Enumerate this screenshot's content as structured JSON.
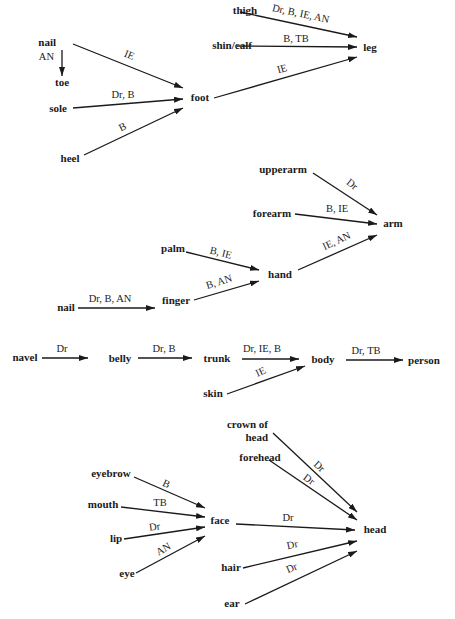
{
  "diagram": {
    "nodes": [
      {
        "id": "nail1",
        "label": "nail",
        "x": 56,
        "y": 46,
        "anchor": "end"
      },
      {
        "id": "toe",
        "label": "toe",
        "x": 62,
        "y": 86,
        "anchor": "middle"
      },
      {
        "id": "sole",
        "label": "sole",
        "x": 58,
        "y": 112,
        "anchor": "middle"
      },
      {
        "id": "heel",
        "label": "heel",
        "x": 70,
        "y": 162,
        "anchor": "middle"
      },
      {
        "id": "foot",
        "label": "foot",
        "x": 200,
        "y": 101,
        "anchor": "middle"
      },
      {
        "id": "thigh",
        "label": "thigh",
        "x": 245,
        "y": 14,
        "anchor": "middle"
      },
      {
        "id": "shin",
        "label": "shin/calf",
        "x": 232,
        "y": 49,
        "anchor": "middle"
      },
      {
        "id": "leg",
        "label": "leg",
        "x": 370,
        "y": 51,
        "anchor": "middle"
      },
      {
        "id": "upperarm",
        "label": "upperarm",
        "x": 283,
        "y": 173,
        "anchor": "middle"
      },
      {
        "id": "forearm",
        "label": "forearm",
        "x": 272,
        "y": 217,
        "anchor": "middle"
      },
      {
        "id": "arm",
        "label": "arm",
        "x": 393,
        "y": 227,
        "anchor": "middle"
      },
      {
        "id": "palm",
        "label": "palm",
        "x": 173,
        "y": 252,
        "anchor": "middle"
      },
      {
        "id": "hand",
        "label": "hand",
        "x": 280,
        "y": 278,
        "anchor": "middle"
      },
      {
        "id": "nail2",
        "label": "nail",
        "x": 66,
        "y": 311,
        "anchor": "middle"
      },
      {
        "id": "finger",
        "label": "finger",
        "x": 176,
        "y": 304,
        "anchor": "middle"
      },
      {
        "id": "navel",
        "label": "navel",
        "x": 25,
        "y": 361,
        "anchor": "middle"
      },
      {
        "id": "belly",
        "label": "belly",
        "x": 120,
        "y": 362,
        "anchor": "middle"
      },
      {
        "id": "trunk",
        "label": "trunk",
        "x": 217,
        "y": 362,
        "anchor": "middle"
      },
      {
        "id": "body",
        "label": "body",
        "x": 323,
        "y": 363,
        "anchor": "middle"
      },
      {
        "id": "person",
        "label": "person",
        "x": 424,
        "y": 364,
        "anchor": "middle"
      },
      {
        "id": "skin",
        "label": "skin",
        "x": 213,
        "y": 397,
        "anchor": "middle"
      },
      {
        "id": "crown",
        "label": "crown of",
        "label2": "head",
        "x": 268,
        "y": 428,
        "anchor": "end"
      },
      {
        "id": "forehead",
        "label": "forehead",
        "x": 260,
        "y": 461,
        "anchor": "middle"
      },
      {
        "id": "eyebrow",
        "label": "eyebrow",
        "x": 111,
        "y": 477,
        "anchor": "middle"
      },
      {
        "id": "mouth",
        "label": "mouth",
        "x": 103,
        "y": 508,
        "anchor": "middle"
      },
      {
        "id": "face",
        "label": "face",
        "x": 220,
        "y": 524,
        "anchor": "middle"
      },
      {
        "id": "head",
        "label": "head",
        "x": 375,
        "y": 533,
        "anchor": "middle"
      },
      {
        "id": "lip",
        "label": "lip",
        "x": 116,
        "y": 542,
        "anchor": "middle"
      },
      {
        "id": "eye",
        "label": "eye",
        "x": 127,
        "y": 577,
        "anchor": "middle"
      },
      {
        "id": "hair",
        "label": "hair",
        "x": 231,
        "y": 571,
        "anchor": "middle"
      },
      {
        "id": "ear",
        "label": "ear",
        "x": 232,
        "y": 607,
        "anchor": "middle"
      }
    ],
    "edges": [
      {
        "from": "nail1",
        "to": "foot",
        "label": "IE",
        "x1": 73,
        "y1": 44,
        "x2": 183,
        "y2": 88,
        "lx": 128,
        "ly": 58,
        "rot": 22
      },
      {
        "from": "nail1",
        "to": "toe",
        "label": "AN",
        "x1": 62,
        "y1": 50,
        "x2": 62,
        "y2": 76,
        "lx": 54,
        "ly": 60,
        "rot": 0,
        "anchor": "end"
      },
      {
        "from": "sole",
        "to": "foot",
        "label": "Dr, B",
        "x1": 73,
        "y1": 108,
        "x2": 183,
        "y2": 99,
        "lx": 123,
        "ly": 98,
        "rot": 0
      },
      {
        "from": "heel",
        "to": "foot",
        "label": "B",
        "x1": 84,
        "y1": 155,
        "x2": 183,
        "y2": 108,
        "lx": 124,
        "ly": 130,
        "rot": -25
      },
      {
        "from": "thigh",
        "to": "leg",
        "label": "Dr, B, IE, AN",
        "x1": 240,
        "y1": 12,
        "x2": 357,
        "y2": 37,
        "lx": 300,
        "ly": 17,
        "rot": 12
      },
      {
        "from": "shin",
        "to": "leg",
        "label": "B, TB",
        "x1": 237,
        "y1": 46,
        "x2": 357,
        "y2": 47,
        "lx": 296,
        "ly": 42,
        "rot": 0
      },
      {
        "from": "foot",
        "to": "leg",
        "label": "IE",
        "x1": 214,
        "y1": 98,
        "x2": 357,
        "y2": 57,
        "lx": 283,
        "ly": 72,
        "rot": -16
      },
      {
        "from": "upperarm",
        "to": "arm",
        "label": "Dr",
        "x1": 313,
        "y1": 173,
        "x2": 377,
        "y2": 215,
        "lx": 350,
        "ly": 187,
        "rot": 38
      },
      {
        "from": "forearm",
        "to": "arm",
        "label": "B, IE",
        "x1": 295,
        "y1": 214,
        "x2": 377,
        "y2": 224,
        "lx": 337,
        "ly": 212,
        "rot": 0
      },
      {
        "from": "hand",
        "to": "arm",
        "label": "IE, AN",
        "x1": 298,
        "y1": 270,
        "x2": 377,
        "y2": 235,
        "lx": 338,
        "ly": 244,
        "rot": -25
      },
      {
        "from": "palm",
        "to": "hand",
        "label": "B, IE",
        "x1": 186,
        "y1": 252,
        "x2": 259,
        "y2": 270,
        "lx": 220,
        "ly": 256,
        "rot": 14
      },
      {
        "from": "finger",
        "to": "hand",
        "label": "B, AN",
        "x1": 194,
        "y1": 300,
        "x2": 259,
        "y2": 281,
        "lx": 220,
        "ly": 285,
        "rot": -17
      },
      {
        "from": "nail2",
        "to": "finger",
        "label": "Dr, B, AN",
        "x1": 78,
        "y1": 308,
        "x2": 155,
        "y2": 308,
        "lx": 110,
        "ly": 302,
        "rot": 0
      },
      {
        "from": "navel",
        "to": "belly",
        "label": "Dr",
        "x1": 42,
        "y1": 358,
        "x2": 88,
        "y2": 358,
        "lx": 62,
        "ly": 352,
        "rot": 0
      },
      {
        "from": "belly",
        "to": "trunk",
        "label": "Dr, B",
        "x1": 138,
        "y1": 358,
        "x2": 192,
        "y2": 358,
        "lx": 164,
        "ly": 352,
        "rot": 0
      },
      {
        "from": "trunk",
        "to": "body",
        "label": "Dr, IE,  B",
        "x1": 242,
        "y1": 359,
        "x2": 299,
        "y2": 359,
        "lx": 262,
        "ly": 352,
        "rot": 0
      },
      {
        "from": "skin",
        "to": "body",
        "label": "IE",
        "x1": 227,
        "y1": 394,
        "x2": 305,
        "y2": 366,
        "lx": 262,
        "ly": 375,
        "rot": -25
      },
      {
        "from": "body",
        "to": "person",
        "label": "Dr, TB",
        "x1": 346,
        "y1": 360,
        "x2": 403,
        "y2": 360,
        "lx": 366,
        "ly": 354,
        "rot": 0
      },
      {
        "from": "crown",
        "to": "head",
        "label": "Dr",
        "x1": 273,
        "y1": 433,
        "x2": 357,
        "y2": 512,
        "lx": 317,
        "ly": 469,
        "rot": 42
      },
      {
        "from": "forehead",
        "to": "head",
        "label": "Dr",
        "x1": 269,
        "y1": 460,
        "x2": 357,
        "y2": 520,
        "lx": 307,
        "ly": 482,
        "rot": 36
      },
      {
        "from": "eyebrow",
        "to": "face",
        "label": "B",
        "x1": 134,
        "y1": 477,
        "x2": 205,
        "y2": 508,
        "lx": 165,
        "ly": 487,
        "rot": 24
      },
      {
        "from": "mouth",
        "to": "face",
        "label": "TB",
        "x1": 121,
        "y1": 507,
        "x2": 205,
        "y2": 517,
        "lx": 160,
        "ly": 506,
        "rot": 0
      },
      {
        "from": "lip",
        "to": "face",
        "label": "Dr",
        "x1": 124,
        "y1": 539,
        "x2": 205,
        "y2": 527,
        "lx": 155,
        "ly": 530,
        "rot": -7
      },
      {
        "from": "eye",
        "to": "face",
        "label": "AN",
        "x1": 136,
        "y1": 573,
        "x2": 205,
        "y2": 536,
        "lx": 165,
        "ly": 552,
        "rot": -30
      },
      {
        "from": "face",
        "to": "head",
        "label": "Dr",
        "x1": 236,
        "y1": 524,
        "x2": 355,
        "y2": 530,
        "lx": 288,
        "ly": 521,
        "rot": 0
      },
      {
        "from": "hair",
        "to": "head",
        "label": "Dr",
        "x1": 243,
        "y1": 568,
        "x2": 357,
        "y2": 541,
        "lx": 293,
        "ly": 548,
        "rot": -12
      },
      {
        "from": "ear",
        "to": "head",
        "label": "Dr",
        "x1": 245,
        "y1": 604,
        "x2": 357,
        "y2": 551,
        "lx": 293,
        "ly": 571,
        "rot": -24
      }
    ]
  }
}
